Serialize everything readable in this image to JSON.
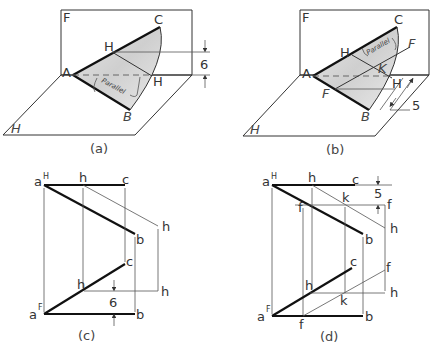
{
  "figures": {
    "a": {
      "caption": "(a)",
      "labels": {
        "frontal_plane": "F",
        "horizontal_plane": "H",
        "A": "A",
        "B": "B",
        "C": "C",
        "H1": "H",
        "H2": "H",
        "parallel": "Parallel",
        "dimension": "6"
      }
    },
    "b": {
      "caption": "(b)",
      "labels": {
        "frontal_plane": "F",
        "horizontal_plane": "H",
        "A": "A",
        "B": "B",
        "C": "C",
        "H1": "H",
        "H2": "H",
        "K": "K",
        "F1": "F",
        "F2": "F",
        "parallel": "Parallel",
        "dimension": "5"
      }
    },
    "c": {
      "caption": "(c)",
      "top_view": {
        "a": "a",
        "a_sup": "H",
        "h": "h",
        "c": "c",
        "b": "b",
        "h_right": "h"
      },
      "front_view": {
        "a": "a",
        "a_sup": "F",
        "h": "h",
        "c": "c",
        "b": "b",
        "h_right": "h"
      },
      "dimension": "6"
    },
    "d": {
      "caption": "(d)",
      "top_view": {
        "a": "a",
        "a_sup": "H",
        "h": "h",
        "c": "c",
        "b": "b",
        "k": "k",
        "f_left": "f",
        "f_right": "f",
        "h_right": "h"
      },
      "front_view": {
        "a": "a",
        "a_sup": "F",
        "h": "h",
        "c": "c",
        "b": "b",
        "k": "k",
        "f_bottom": "f",
        "f_right": "f",
        "h_right": "h"
      },
      "dimension": "5"
    }
  }
}
